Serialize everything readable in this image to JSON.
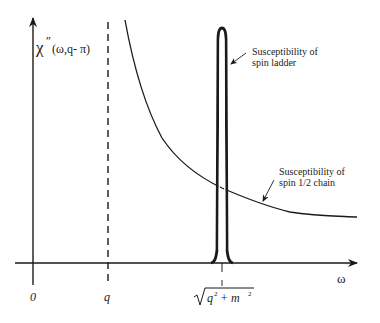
{
  "diagram": {
    "y_axis_label": {
      "symbol": "χ",
      "prime": "″",
      "args": "(ω,q- π)"
    },
    "x_axis_label": "ω",
    "x_ticks": [
      {
        "label": "0"
      },
      {
        "label": "q"
      },
      {
        "label_sqrt": "q² + m²",
        "radicand_q": "q",
        "radicand_plus": "+ m",
        "exp": "2"
      }
    ],
    "annotations": [
      {
        "line1": "Susceptibility of",
        "line2": "spin ladder"
      },
      {
        "line1": "Susceptibility of",
        "line2": "spin 1/2 chain"
      }
    ],
    "curves": [
      {
        "name": "spin ladder susceptibility",
        "shape": "sharp peak at sqrt(q^2+m^2)"
      },
      {
        "name": "spin 1/2 chain susceptibility",
        "shape": "decaying continuum starting at ω = q"
      }
    ],
    "reference_line": {
      "position": "q",
      "style": "dashed"
    },
    "colors": {
      "ink": "#1a1a1a",
      "background": "#ffffff"
    }
  }
}
